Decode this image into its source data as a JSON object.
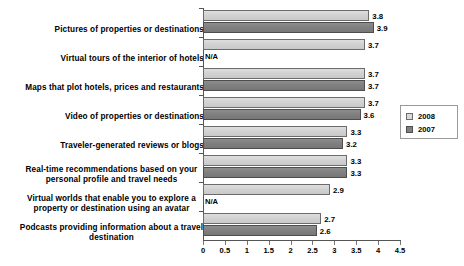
{
  "chart_data": {
    "type": "bar",
    "orientation": "horizontal",
    "title": "",
    "xlabel": "",
    "ylabel": "",
    "xlim": [
      0,
      4.5
    ],
    "xticks": [
      "0",
      "0.5",
      "1",
      "1.5",
      "2",
      "2.5",
      "3",
      "3.5",
      "4",
      "4.5"
    ],
    "grid": false,
    "legend_position": "right",
    "na_label": "N/A",
    "colors": {
      "series_2008": "#d3d3d3",
      "series_2007": "#808080",
      "axis": "#555555",
      "text": "#000000",
      "background": "#ffffff"
    },
    "categories": [
      "Pictures of properties or destinations",
      "Virtual tours of the interior of hotels",
      "Maps that plot hotels, prices and restaurants",
      "Video of properties or destinations",
      "Traveler-generated reviews or blogs",
      "Real-time recommendations based on your personal profile and travel needs",
      "Virtual worlds that enable you to explore a property or destination using an avatar",
      "Podcasts providing information about a travel destination"
    ],
    "category_lines": [
      [
        "Pictures of properties or destinations"
      ],
      [
        "Virtual tours of the interior of hotels"
      ],
      [
        "Maps that plot hotels, prices and restaurants"
      ],
      [
        "Video of properties or destinations"
      ],
      [
        "Traveler-generated reviews or blogs"
      ],
      [
        "Real-time recommendations based on your",
        "personal profile and travel needs"
      ],
      [
        "Virtual worlds that enable you to explore a",
        "property or destination using an avatar"
      ],
      [
        "Podcasts providing information about a travel",
        "destination"
      ]
    ],
    "series": [
      {
        "name": "2008",
        "values": [
          3.8,
          3.7,
          3.7,
          3.7,
          3.3,
          3.3,
          2.9,
          2.7
        ],
        "labels": [
          "3.8",
          "3.7",
          "3.7",
          "3.7",
          "3.3",
          "3.3",
          "2.9",
          "2.7"
        ]
      },
      {
        "name": "2007",
        "values": [
          3.9,
          null,
          3.7,
          3.6,
          3.2,
          3.3,
          null,
          2.6
        ],
        "labels": [
          "3.9",
          "N/A",
          "3.7",
          "3.6",
          "3.2",
          "3.3",
          "N/A",
          "2.6"
        ]
      }
    ]
  },
  "legend": {
    "entries": [
      {
        "label": "2008"
      },
      {
        "label": "2007"
      }
    ]
  }
}
